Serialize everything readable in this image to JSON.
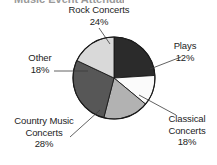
{
  "figure": {
    "clipped_title": "Music Event Attendance",
    "background_color": "#ffffff",
    "outline_color": "#1a1a1a"
  },
  "chart_data": {
    "type": "pie",
    "title": "",
    "xlabel": "",
    "ylabel": "",
    "legend_position": "none",
    "grid": false,
    "units": "percent",
    "start_angle_deg": 0,
    "direction": "clockwise",
    "categories": [
      "Rock Concerts",
      "Plays",
      "Classical Concerts",
      "Country Music Concerts",
      "Other"
    ],
    "values": [
      24,
      12,
      18,
      28,
      18
    ],
    "slices": [
      {
        "label": "Rock Concerts",
        "value": 24,
        "percent_text": "24%",
        "color": "#2b2b2b",
        "start_deg": 0,
        "end_deg": 86.4
      },
      {
        "label": "Plays",
        "value": 12,
        "percent_text": "12%",
        "color": "#fbfbfb",
        "start_deg": 86.4,
        "end_deg": 129.6
      },
      {
        "label": "Classical Concerts",
        "value": 18,
        "percent_text": "18%",
        "color": "#b2b2b2",
        "start_deg": 129.6,
        "end_deg": 194.4
      },
      {
        "label": "Country Music Concerts",
        "value": 28,
        "percent_text": "28%",
        "color": "#575757",
        "start_deg": 194.4,
        "end_deg": 295.2
      },
      {
        "label": "Other",
        "value": 18,
        "percent_text": "18%",
        "color": "#d9d9d9",
        "start_deg": 295.2,
        "end_deg": 360
      }
    ]
  },
  "labels": {
    "rock": {
      "name": "Rock Concerts",
      "percent": "24%"
    },
    "plays": {
      "name": "Plays",
      "percent": "12%"
    },
    "classical_line1": "Classical",
    "classical_line2": "Concerts",
    "classical_percent": "18%",
    "country_line1": "Country Music",
    "country_line2": "Concerts",
    "country_percent": "28%",
    "other": {
      "name": "Other",
      "percent": "18%"
    }
  }
}
